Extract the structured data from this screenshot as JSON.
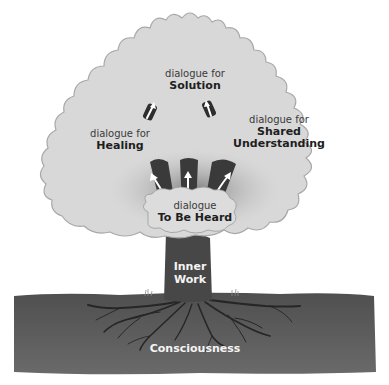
{
  "diagram": {
    "nodes": [
      {
        "id": "solution",
        "prefix": "dialogue for",
        "name": "Solution"
      },
      {
        "id": "healing",
        "prefix": "dialogue for",
        "name": "Healing"
      },
      {
        "id": "shared_understanding",
        "prefix": "dialogue for",
        "name": "Shared Understanding",
        "name_line1": "Shared",
        "name_line2": "Understanding"
      },
      {
        "id": "to_be_heard",
        "prefix": "dialogue",
        "name": "To Be Heard"
      }
    ],
    "trunk": {
      "line1": "Inner",
      "line2": "Work"
    },
    "ground": {
      "label": "Consciousness"
    },
    "arrows": [
      {
        "from": "to_be_heard",
        "to": "healing"
      },
      {
        "from": "to_be_heard",
        "to": "solution"
      },
      {
        "from": "to_be_heard",
        "to": "shared_understanding"
      },
      {
        "from": "healing",
        "to": "solution"
      },
      {
        "from": "shared_understanding",
        "to": "solution"
      }
    ],
    "colors": {
      "canopy": "#d9d9d9",
      "canopy_edge": "#9a9a9a",
      "branch_dark": "#3c3c3c",
      "trunk": "#4a4a4a",
      "ground": "#5e5e5e",
      "roots": "#2a2a2a",
      "arrow": "#ffffff"
    }
  }
}
